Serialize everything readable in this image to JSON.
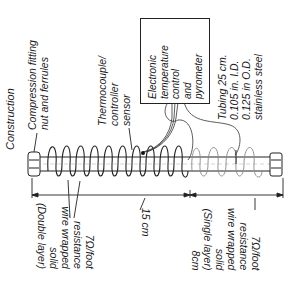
{
  "title": "Construction",
  "labels": {
    "compression_fitting": [
      "Compression fitting",
      "nut and ferrules"
    ],
    "thermocouple": [
      "Thermocouple/",
      "controller",
      "sensor"
    ],
    "controller_box": [
      "Electronic",
      "temperature",
      "control",
      "and",
      "pyrometer"
    ],
    "tubing": [
      "Tubing 25 cm.",
      "0.105 in. I.D.",
      "0.125 in O.D.",
      "stainless steel"
    ],
    "left_winding": [
      "7Ω/foot",
      "resistance",
      "wire wrapped",
      "solid",
      "(Double layer)"
    ],
    "right_winding": [
      "7Ω/foot",
      "resistance",
      "wire wrapped",
      "solid",
      "(Single layer)",
      "8cm"
    ],
    "dimension_left": "15 cm"
  },
  "colors": {
    "ink": "#1a1a1a",
    "faint": "#9a9a9a",
    "background": "#ffffff"
  }
}
